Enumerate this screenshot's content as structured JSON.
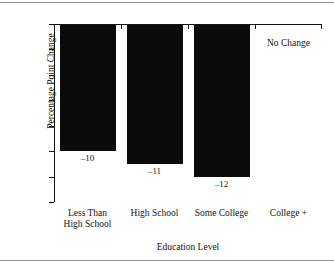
{
  "figure": {
    "background": "#ffffff",
    "rule_color": "#8e8e8e",
    "bar_color": "#0a0a0a",
    "axis_color": "#141414"
  },
  "chart_data": {
    "type": "bar",
    "title": "",
    "xlabel": "Education Level",
    "ylabel": "Percentage Point Change",
    "categories": [
      "Less Than High School",
      "High School",
      "Some College",
      "College +"
    ],
    "category_lines": [
      [
        "Less Than",
        "High School"
      ],
      [
        "High School"
      ],
      [
        "Some College"
      ],
      [
        "College +"
      ]
    ],
    "values": [
      -10,
      -11,
      -12,
      0
    ],
    "data_labels": [
      "–10",
      "–11",
      "–12",
      ""
    ],
    "ylim": [
      -14,
      0
    ],
    "yticks": [
      0,
      -2,
      -4,
      -6,
      -8,
      -10,
      -12,
      -14
    ],
    "ytick_labels": [
      "0",
      "-2",
      "-4",
      "-6",
      "-8",
      "-10",
      "-12",
      "-14"
    ],
    "grid": false,
    "legend": "none",
    "annotations": [
      {
        "text": "No Change",
        "category": "College +",
        "value": 0
      }
    ]
  }
}
